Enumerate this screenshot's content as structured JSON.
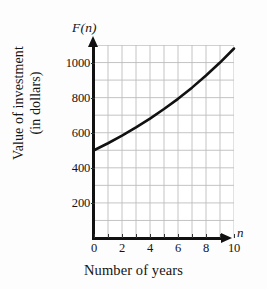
{
  "chart_data": {
    "type": "line",
    "title": "",
    "xlabel": "Number of years",
    "ylabel_line1": "Value of investment",
    "ylabel_line2": "(in dollars)",
    "y_axis_symbol": "F(n)",
    "x_axis_symbol": "n",
    "xlim": [
      0,
      10
    ],
    "ylim": [
      0,
      1100
    ],
    "grid": true,
    "grid_color": "#bdbdbd",
    "curve_color": "#111111",
    "legend": null,
    "x_major_ticks": [
      0,
      2,
      4,
      6,
      8,
      10
    ],
    "x_minor_ticks": [
      1,
      3,
      5,
      7,
      9
    ],
    "x_tick_labels": [
      "0",
      "2",
      "4",
      "6",
      "8",
      "10"
    ],
    "y_major_ticks": [
      200,
      400,
      600,
      800,
      1000
    ],
    "y_tick_labels": [
      "200",
      "400",
      "600",
      "800",
      "1000"
    ],
    "series": [
      {
        "name": "F(n) = 500(1.08)^n",
        "x": [
          0,
          1,
          2,
          3,
          4,
          5,
          6,
          7,
          8,
          9,
          10
        ],
        "values": [
          500,
          540,
          583,
          630,
          680,
          735,
          793,
          857,
          926,
          1000,
          1080
        ]
      }
    ]
  }
}
